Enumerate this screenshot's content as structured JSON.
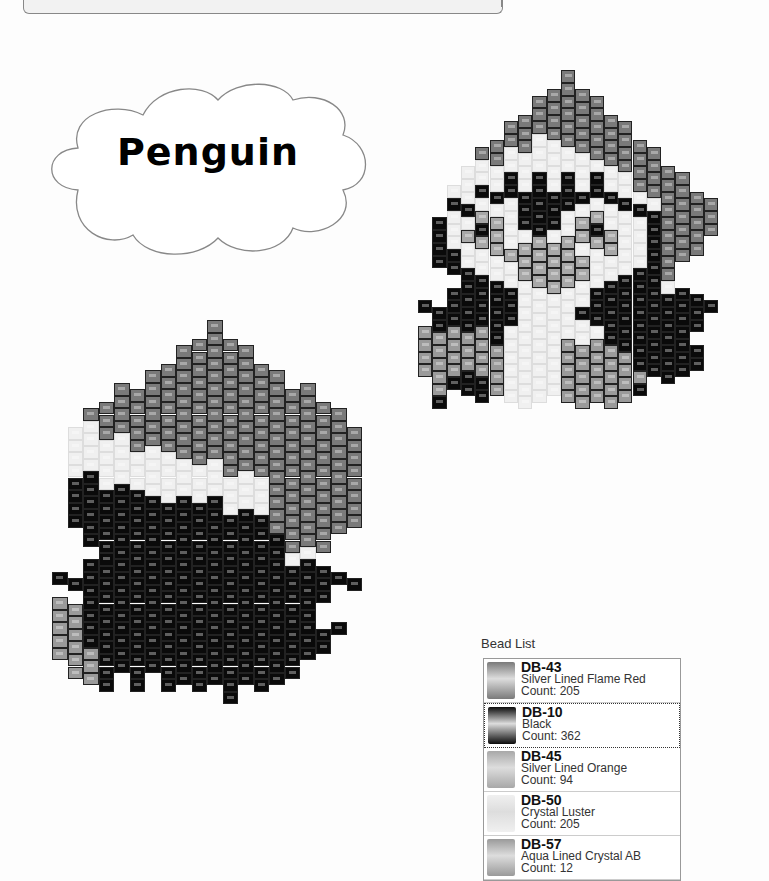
{
  "title": "Penguin",
  "bead_list": {
    "title": "Bead List",
    "items": [
      {
        "code": "DB-43",
        "name": "Silver Lined Flame Red",
        "count": "Count: 205",
        "color": "#7a7a7a",
        "key": "R"
      },
      {
        "code": "DB-10",
        "name": "Black",
        "count": "Count: 362",
        "color": "#0a0a0a",
        "key": "K",
        "selected": true
      },
      {
        "code": "DB-45",
        "name": "Silver Lined Orange",
        "count": "Count: 94",
        "color": "#a8a8a8",
        "key": "O"
      },
      {
        "code": "DB-50",
        "name": "Crystal Luster",
        "count": "Count: 205",
        "color": "#f0f0f0",
        "key": "W"
      },
      {
        "code": "DB-57",
        "name": "Aqua Lined Crystal AB",
        "count": "Count: 12",
        "color": "#9a9a9a",
        "key": "A"
      }
    ]
  },
  "patterns": {
    "front": {
      "left": 418,
      "top": 70,
      "col_w": 14.3,
      "row_h": 12.8,
      "rows": [
        "..........R..........",
        ".........RRR.........",
        "........RRRRR........",
        ".......RRRRRRR.......",
        "......RRRRRRRRR......",
        ".....RRRWWRRRRRR.....",
        "....RRWWWWWWRRRRR....",
        "...WWWWWWWWWWWRRRR...",
        "...WWWKWKWKWKWWRRRR..",
        "..WWKKKKKKKKKKWWRRRR.",
        "..KKWWWKKKKWWWKKWRRRR",
        ".KWWOOWKKKWOOWWWKRRRR",
        ".KWOKOWWKWWOKOWWKRRRR",
        ".KWWOOWOOOOWOOWWKRRR.",
        ".KKWWWOOOOOOWWWWKRR..",
        "..KKWWWOOOOOWWWKKR...",
        "...KKKWWOOOWWKKKKW...",
        "..KKKKKWWWWWKKKKKKKK.",
        "KKKKKKKWWWWKKKKKKKKKK",
        ".KKKKKKWWWWWKKKKKKKK.",
        "AAAAAKWWWWWWWKKKKKK..",
        "AAAAAAWWWWAAAAKKKKKK.",
        "AAAAAAWWWWAAAAAKKKKK.",
        "AAAKAAWWWWAAAAAAKKK..",
        ".AKKKAWWWWAAAAAK.....",
        ".K..K.WWW.AAAAA......"
      ]
    },
    "side": {
      "left": 52,
      "top": 320,
      "col_w": 15.5,
      "row_h": 12.6,
      "rows": [
        "..........R.........",
        ".........RRR........",
        "........RRRRR.......",
        ".......RRRRRRR......",
        "......RRRRRRRRR.....",
        "....RRRRRRRRRRRRR...",
        "...RRRRRRRRRRRRRRR..",
        "..RRRRRRRRRRRRRRRRR.",
        ".WWRRRRRRRRRRRRRRRRR",
        ".WWWWRRRRRRRRRRRRRRR",
        ".WWWWWWWRRRRRRRRRRRR",
        ".WWWWWWWWWWRRRRRRRRR",
        ".KKWWWWWWWWWWWRRRRRR",
        ".KKKKKWWWWWWWWRRRRRR",
        ".KKKKKKKKKKWWWRRRRRR",
        ".KKKKKKKKKKKKKRRRRRR",
        "..KKKKKKKKKKKKRRRRR.",
        "..KKKKKKKKKKKKKRRR..",
        "...KKKKKKKKKKKKWW...",
        "..KKKKKKKKKKKKKKKK..",
        "KKKKKKKKKKKKKKKKKKKK",
        "..KKKKKKKKKKKKKKKK..",
        "AAKKKKKKKKKKKKKKK...",
        "AAKKKKKKKKKKKKKKK...",
        "AAKKKKKKKKKKKKKKKKK.",
        "AAKKKKKKKKKKKKKKKK..",
        "AAAKKKKKKKKKKKKKK...",
        ".AAKKKKKKKKKKKKK....",
        "..AK.K.KKKKKKKK.....",
        "...........K........"
      ]
    }
  }
}
